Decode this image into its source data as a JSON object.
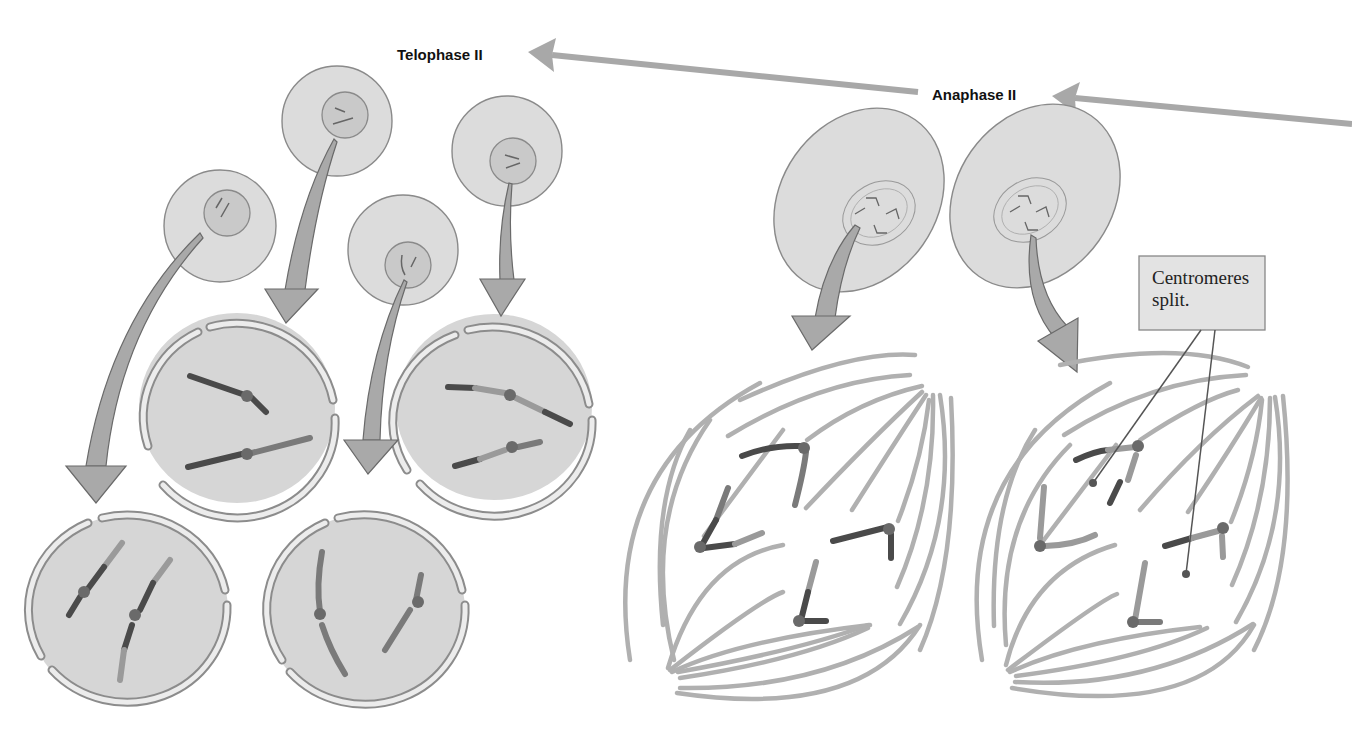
{
  "diagram": {
    "stages": [
      {
        "id": "telophase-ii",
        "label": "Telophase II"
      },
      {
        "id": "anaphase-ii",
        "label": "Anaphase II"
      }
    ],
    "callout": {
      "line1": "Centromeres",
      "line2": "split."
    },
    "colors": {
      "cell": "#dcdcdc",
      "outline": "#8a8a8a",
      "spindle": "#b0b0b0",
      "chromosome_dark": "#4a4a4a",
      "arrow": "#a9a9a9"
    },
    "elements": {
      "telophase_small_cells": 4,
      "telophase_enlarged_cells": 4,
      "anaphase_small_cells": 2,
      "anaphase_enlarged_spindles": 2
    }
  }
}
